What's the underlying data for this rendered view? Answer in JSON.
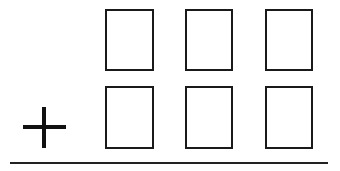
{
  "diagram": {
    "type": "column-addition-template",
    "operator": "plus",
    "rows": 2,
    "columns": 3,
    "digit_boxes": [
      {
        "row": 1,
        "col": 1,
        "value": ""
      },
      {
        "row": 1,
        "col": 2,
        "value": ""
      },
      {
        "row": 1,
        "col": 3,
        "value": ""
      },
      {
        "row": 2,
        "col": 1,
        "value": ""
      },
      {
        "row": 2,
        "col": 2,
        "value": ""
      },
      {
        "row": 2,
        "col": 3,
        "value": ""
      }
    ],
    "colors": {
      "stroke": "#1a1a1a",
      "background": "#ffffff"
    }
  }
}
